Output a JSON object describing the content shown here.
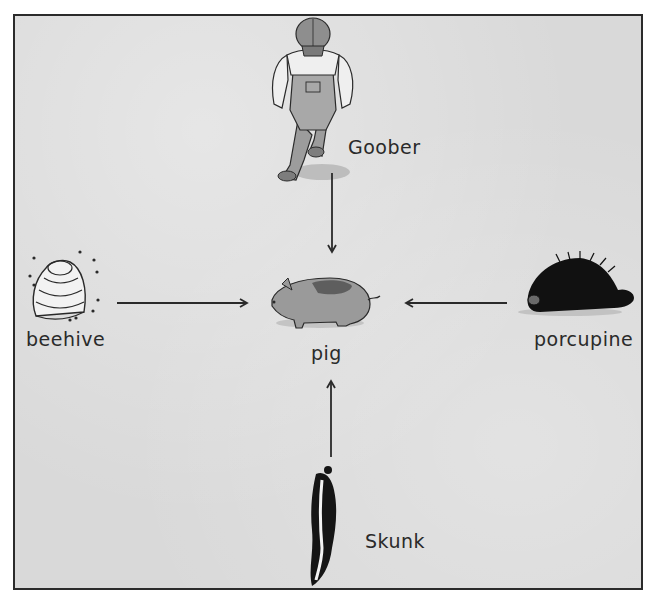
{
  "diagram": {
    "type": "radial-arrows-to-center",
    "center": {
      "id": "pig",
      "label": "pig",
      "icon": "pig-icon"
    },
    "nodes": [
      {
        "id": "goober",
        "label": "Goober",
        "icon": "farmer-icon",
        "position": "top",
        "arrow_to": "pig",
        "arrow_direction": "down"
      },
      {
        "id": "beehive",
        "label": "beehive",
        "icon": "beehive-icon",
        "position": "left",
        "arrow_to": "pig",
        "arrow_direction": "right"
      },
      {
        "id": "porcupine",
        "label": "porcupine",
        "icon": "porcupine-icon",
        "position": "right",
        "arrow_to": "pig",
        "arrow_direction": "left"
      },
      {
        "id": "skunk",
        "label": "Skunk",
        "icon": "skunk-icon",
        "position": "bottom",
        "arrow_to": "pig",
        "arrow_direction": "up"
      }
    ],
    "colors": {
      "background": "#d9d9d9",
      "frame_border": "#2b2b2b",
      "ink": "#2a2a2a",
      "pig_fill": "#9a9a9a",
      "pig_spot": "#5e5e5e",
      "porcupine_fill": "#111111",
      "skunk_fill": "#151515"
    }
  }
}
